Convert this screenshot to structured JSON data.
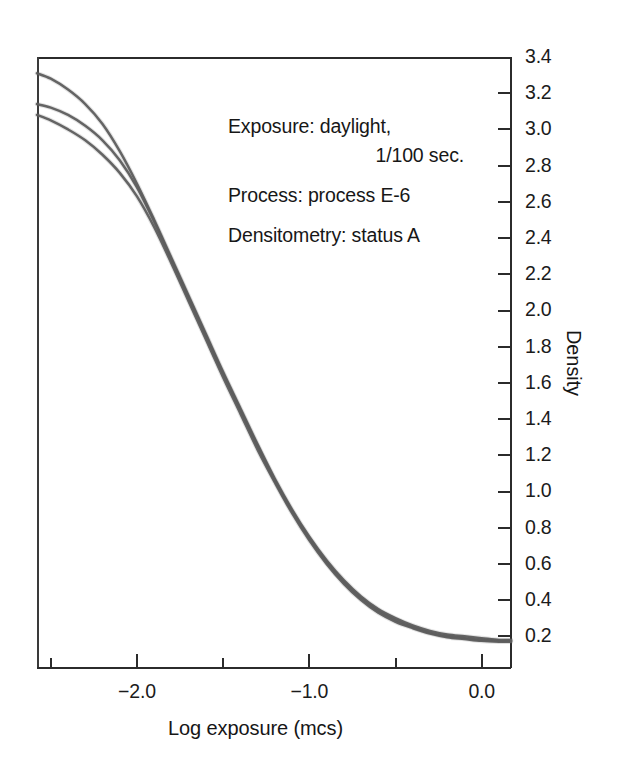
{
  "figure": {
    "title": "",
    "background_color": "#ffffff",
    "axis_color": "#2b2b2b",
    "curve_color": "#5d5d5d",
    "curve_color_dark": "#3d3d3d"
  },
  "axes": {
    "x": {
      "label": "Log exposure (mcs)",
      "tick_labels": [
        "-2.0",
        "-1.0",
        "0.0"
      ],
      "tick_values": [
        -2.0,
        -1.0,
        0.0
      ],
      "range": [
        -2.58,
        0.17
      ],
      "minor_tick_values": [
        -2.5,
        -1.5,
        -0.5
      ]
    },
    "y": {
      "label": "Density",
      "tick_labels": [
        "3.4",
        "3.2",
        "3.0",
        "2.8",
        "2.6",
        "2.4",
        "2.2",
        "2.0",
        "1.8",
        "1.6",
        "1.4",
        "1.2",
        "1.0",
        "0.8",
        "0.6",
        "0.4",
        "0.2"
      ],
      "tick_values": [
        3.4,
        3.2,
        3.0,
        2.8,
        2.6,
        2.4,
        2.2,
        2.0,
        1.8,
        1.6,
        1.4,
        1.2,
        1.0,
        0.8,
        0.6,
        0.4,
        0.2
      ],
      "range": [
        0.025,
        3.4
      ]
    }
  },
  "annotations": [
    {
      "line": "Exposure: daylight,",
      "align": "left"
    },
    {
      "line": "1/100 sec.",
      "align": "right"
    },
    {
      "line": "Process: process E-6",
      "align": "left"
    },
    {
      "line": "Densitometry: status A",
      "align": "left"
    }
  ],
  "chart_data": {
    "type": "line",
    "title": "",
    "xlabel": "Log exposure (mcs)",
    "ylabel": "Density",
    "xlim": [
      -2.58,
      0.17
    ],
    "ylim": [
      0.025,
      3.4
    ],
    "grid": false,
    "legend": false,
    "legend_position": "none",
    "x": [
      -2.58,
      -2.5,
      -2.4,
      -2.3,
      -2.2,
      -2.1,
      -2.0,
      -1.9,
      -1.8,
      -1.7,
      -1.6,
      -1.5,
      -1.4,
      -1.3,
      -1.2,
      -1.1,
      -1.0,
      -0.9,
      -0.8,
      -0.7,
      -0.6,
      -0.5,
      -0.4,
      -0.3,
      -0.2,
      -0.1,
      0.0,
      0.1,
      0.17
    ],
    "series": [
      {
        "name": "curve-1",
        "values": [
          3.31,
          3.28,
          3.22,
          3.14,
          3.03,
          2.88,
          2.7,
          2.5,
          2.29,
          2.08,
          1.87,
          1.66,
          1.46,
          1.26,
          1.07,
          0.9,
          0.75,
          0.62,
          0.51,
          0.42,
          0.35,
          0.3,
          0.26,
          0.23,
          0.21,
          0.2,
          0.19,
          0.18,
          0.18
        ]
      },
      {
        "name": "curve-2",
        "values": [
          3.14,
          3.12,
          3.08,
          3.02,
          2.94,
          2.83,
          2.68,
          2.49,
          2.28,
          2.07,
          1.86,
          1.65,
          1.45,
          1.25,
          1.06,
          0.89,
          0.74,
          0.61,
          0.5,
          0.41,
          0.34,
          0.29,
          0.25,
          0.22,
          0.2,
          0.19,
          0.18,
          0.175,
          0.175
        ]
      },
      {
        "name": "curve-3",
        "values": [
          3.08,
          3.05,
          3.0,
          2.94,
          2.86,
          2.76,
          2.63,
          2.46,
          2.26,
          2.05,
          1.84,
          1.63,
          1.43,
          1.23,
          1.05,
          0.88,
          0.73,
          0.6,
          0.49,
          0.4,
          0.33,
          0.28,
          0.245,
          0.215,
          0.195,
          0.185,
          0.175,
          0.17,
          0.17
        ]
      }
    ]
  }
}
